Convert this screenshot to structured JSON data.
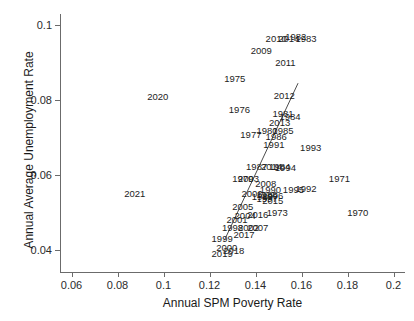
{
  "chart_data": {
    "type": "scatter",
    "title": "",
    "xlabel": "Annual SPM Poverty Rate",
    "ylabel": "Annual Average Unemployment Rate",
    "xlim": [
      0.055,
      0.205
    ],
    "ylim": [
      0.034,
      0.103
    ],
    "xticks": [
      "0.06",
      "0.08",
      "0.1",
      "0.12",
      "0.14",
      "0.16",
      "0.18",
      "0.2"
    ],
    "xtick_values": [
      0.06,
      0.08,
      0.1,
      0.12,
      0.14,
      0.16,
      0.18,
      0.2
    ],
    "yticks": [
      "0.04",
      "0.06",
      "0.08",
      "0.1"
    ],
    "ytick_values": [
      0.04,
      0.06,
      0.08,
      0.1
    ],
    "grid": false,
    "legend": "none",
    "point_marker": "year-text-label",
    "fit_line": {
      "type": "linear-regression",
      "x_start": 0.1265,
      "y_start": 0.0425,
      "x_end": 0.1585,
      "y_end": 0.0845,
      "color": "#4d4d4d"
    },
    "points": [
      {
        "label": "1970",
        "x": 0.1845,
        "y": 0.0497
      },
      {
        "label": "1971",
        "x": 0.1765,
        "y": 0.0588
      },
      {
        "label": "1973",
        "x": 0.1495,
        "y": 0.0497
      },
      {
        "label": "1975",
        "x": 0.131,
        "y": 0.0857
      },
      {
        "label": "1976",
        "x": 0.133,
        "y": 0.0772
      },
      {
        "label": "1977",
        "x": 0.138,
        "y": 0.0706
      },
      {
        "label": "1979",
        "x": 0.1345,
        "y": 0.059
      },
      {
        "label": "1980",
        "x": 0.145,
        "y": 0.0718
      },
      {
        "label": "1981",
        "x": 0.152,
        "y": 0.0762
      },
      {
        "label": "1982",
        "x": 0.1575,
        "y": 0.0968
      },
      {
        "label": "1983",
        "x": 0.162,
        "y": 0.0962
      },
      {
        "label": "1984",
        "x": 0.155,
        "y": 0.0755
      },
      {
        "label": "1985",
        "x": 0.152,
        "y": 0.0718
      },
      {
        "label": "1986",
        "x": 0.149,
        "y": 0.07
      },
      {
        "label": "1987",
        "x": 0.1405,
        "y": 0.0622
      },
      {
        "label": "1988",
        "x": 0.145,
        "y": 0.0545
      },
      {
        "label": "1989",
        "x": 0.143,
        "y": 0.054
      },
      {
        "label": "1990",
        "x": 0.1465,
        "y": 0.056
      },
      {
        "label": "1991",
        "x": 0.148,
        "y": 0.068
      },
      {
        "label": "1992",
        "x": 0.162,
        "y": 0.0562
      },
      {
        "label": "1993",
        "x": 0.164,
        "y": 0.0672
      },
      {
        "label": "1994",
        "x": 0.153,
        "y": 0.0618
      },
      {
        "label": "1995",
        "x": 0.1565,
        "y": 0.056
      },
      {
        "label": "1996",
        "x": 0.1475,
        "y": 0.0542
      },
      {
        "label": "1997",
        "x": 0.145,
        "y": 0.0535
      },
      {
        "label": "1998",
        "x": 0.13,
        "y": 0.0458
      },
      {
        "label": "1999",
        "x": 0.1255,
        "y": 0.0428
      },
      {
        "label": "2000",
        "x": 0.1275,
        "y": 0.0405
      },
      {
        "label": "2001",
        "x": 0.132,
        "y": 0.0478
      },
      {
        "label": "2002",
        "x": 0.137,
        "y": 0.0458
      },
      {
        "label": "2003",
        "x": 0.137,
        "y": 0.0588
      },
      {
        "label": "2004",
        "x": 0.1355,
        "y": 0.049
      },
      {
        "label": "2005",
        "x": 0.1345,
        "y": 0.0515
      },
      {
        "label": "2006",
        "x": 0.1385,
        "y": 0.0548
      },
      {
        "label": "2007",
        "x": 0.141,
        "y": 0.0458
      },
      {
        "label": "2008",
        "x": 0.1445,
        "y": 0.0575
      },
      {
        "label": "2009",
        "x": 0.1425,
        "y": 0.0932
      },
      {
        "label": "2010",
        "x": 0.149,
        "y": 0.0963
      },
      {
        "label": "2011",
        "x": 0.153,
        "y": 0.0898
      },
      {
        "label": "2012",
        "x": 0.1525,
        "y": 0.0812
      },
      {
        "label": "2013",
        "x": 0.1505,
        "y": 0.0738
      },
      {
        "label": "2014",
        "x": 0.1545,
        "y": 0.0962
      },
      {
        "label": "2015",
        "x": 0.1475,
        "y": 0.053
      },
      {
        "label": "2016",
        "x": 0.141,
        "y": 0.0492
      },
      {
        "label": "2017",
        "x": 0.135,
        "y": 0.044
      },
      {
        "label": "2018",
        "x": 0.1305,
        "y": 0.0395
      },
      {
        "label": "2019",
        "x": 0.1255,
        "y": 0.0388
      },
      {
        "label": "2020",
        "x": 0.0975,
        "y": 0.0808
      },
      {
        "label": "2021",
        "x": 0.0875,
        "y": 0.0548
      },
      {
        "label": "1984b",
        "x": 0.1505,
        "y": 0.0622
      },
      {
        "label": "2014b",
        "x": 0.147,
        "y": 0.062
      }
    ]
  }
}
